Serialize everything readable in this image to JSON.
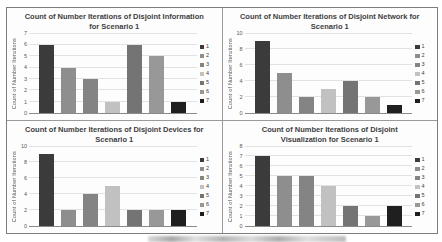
{
  "figure": {
    "description_note": "2x2 montage of bar charts",
    "caption_visible": false
  },
  "colors": {
    "panel_border": "#7d7d7d",
    "gridline": "#e2e2e2",
    "axis_line": "#8a8a8a",
    "title_text": "#404040",
    "tick_text": "#595959",
    "series": [
      "#3b3b3b",
      "#8e8e8e",
      "#848484",
      "#c1c1c1",
      "#747474",
      "#989898",
      "#1f1f1f"
    ]
  },
  "chart_data": [
    {
      "type": "bar",
      "title": "Count of Number Iterations of Disjoint Information for Scenario 1",
      "xlabel": "",
      "ylabel": "Count of Number Iterations",
      "categories": [
        "1",
        "2",
        "3",
        "4",
        "5",
        "6",
        "7"
      ],
      "values": [
        6,
        4,
        3,
        1,
        6,
        5,
        1
      ],
      "ylim": [
        0,
        7
      ],
      "yticks": [
        0,
        1,
        2,
        3,
        4,
        5,
        6,
        7
      ],
      "grid": true,
      "legend_position": "right",
      "legend_labels": [
        "1",
        "2",
        "3",
        "4",
        "5",
        "6",
        "7"
      ]
    },
    {
      "type": "bar",
      "title": "Count of Number Iterations of Disjoint Network for Scenario 1",
      "xlabel": "",
      "ylabel": "Count of Number Iterations",
      "categories": [
        "1",
        "2",
        "3",
        "4",
        "5",
        "6",
        "7"
      ],
      "values": [
        9,
        5,
        2,
        3,
        4,
        2,
        1
      ],
      "ylim": [
        0,
        10
      ],
      "yticks": [
        0,
        2,
        4,
        6,
        8,
        10
      ],
      "grid": true,
      "legend_position": "right",
      "legend_labels": [
        "1",
        "2",
        "3",
        "4",
        "5",
        "6",
        "7"
      ]
    },
    {
      "type": "bar",
      "title": "Count of Number Iterations of Disjoint Devices for Scenario 1",
      "xlabel": "",
      "ylabel": "Count of Number Iterations",
      "categories": [
        "1",
        "2",
        "3",
        "4",
        "5",
        "6",
        "7"
      ],
      "values": [
        9,
        2,
        4,
        5,
        2,
        2,
        2
      ],
      "ylim": [
        0,
        10
      ],
      "yticks": [
        0,
        2,
        4,
        6,
        8,
        10
      ],
      "grid": true,
      "legend_position": "right",
      "legend_labels": [
        "1",
        "2",
        "3",
        "4",
        "5",
        "6",
        "7"
      ]
    },
    {
      "type": "bar",
      "title": "Count of Number Iterations of Disjoint Visualization for Scenario 1",
      "xlabel": "",
      "ylabel": "Count of Number Iterations",
      "categories": [
        "1",
        "2",
        "3",
        "4",
        "5",
        "6",
        "7"
      ],
      "values": [
        7,
        5,
        5,
        4,
        2,
        1,
        2
      ],
      "ylim": [
        0,
        8
      ],
      "yticks": [
        0,
        1,
        2,
        3,
        4,
        5,
        6,
        7,
        8
      ],
      "grid": true,
      "legend_position": "right",
      "legend_labels": [
        "1",
        "2",
        "3",
        "4",
        "5",
        "6",
        "7"
      ]
    }
  ]
}
